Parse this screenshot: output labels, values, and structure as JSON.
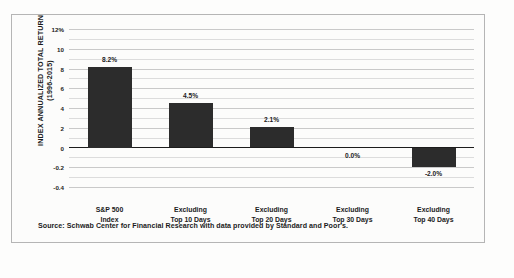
{
  "chart_data": {
    "type": "bar",
    "title": "",
    "subtitle": "",
    "xlabel": "",
    "ylabel": "INDEX ANNUALIZED TOTAL RETURN (1996-2015)",
    "ylabel_line1": "INDEX ANNUALIZED TOTAL RETURN",
    "ylabel_line2": "(1996-2015)",
    "categories": [
      "S&P 500 Index",
      "Excluding Top 10 Days",
      "Excluding Top 20 Days",
      "Excluding Top 30 Days",
      "Excluding Top 40 Days"
    ],
    "category_lines": [
      [
        "S&P 500",
        "Index"
      ],
      [
        "Excluding",
        "Top 10 Days"
      ],
      [
        "Excluding",
        "Top 20 Days"
      ],
      [
        "Excluding",
        "Top 30 Days"
      ],
      [
        "Excluding",
        "Top 40 Days"
      ]
    ],
    "values": [
      8.2,
      4.5,
      2.1,
      0.0,
      -2.0
    ],
    "data_labels": [
      "8.2%",
      "4.5%",
      "2.1%",
      "0.0%",
      "-2.0%"
    ],
    "ylim": [
      -4,
      12
    ],
    "ytick_labels": [
      "12%",
      "10",
      "8",
      "6",
      "4",
      "2",
      "0",
      "-0.2",
      "-0.4"
    ],
    "ytick_values": [
      12,
      10,
      8,
      6,
      4,
      2,
      0,
      -2,
      -4
    ],
    "grid": true,
    "minor_grid": true,
    "legend": "none",
    "bar_color": "#2c2c2c",
    "gridline_color": "#c9c9c9",
    "zero_line_color": "#1c1c1c"
  },
  "footer": {
    "source": "Source: Schwab Center for Financial Research with data provided by Standard and Poor's."
  }
}
